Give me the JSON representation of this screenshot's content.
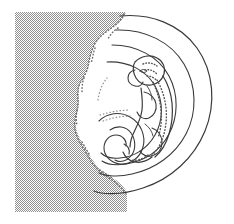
{
  "figure": {
    "title": "Embryo curled within concentric spiral membranes",
    "style": "pen-and-ink line drawing",
    "background_color": "#ffffff",
    "stroke_color": "#3a3a3a",
    "canvas": {
      "width": 234,
      "height": 224
    }
  },
  "regions": {
    "hatched_block": {
      "label": "stippled maternal tissue block",
      "fill_color": "#9e9e9e",
      "pattern": "checkerboard-stipple",
      "pattern_cell_px": 2,
      "bounds": {
        "x": 15,
        "y": 12,
        "width": 115,
        "height": 200
      }
    },
    "scalloped_edge": {
      "label": "scalloped dotted membrane boundary",
      "dot_color": "#6e6e6e",
      "dot_radius": 0.9
    }
  },
  "elements": {
    "spiral_arcs": {
      "label": "concentric membrane spirals",
      "count": 4,
      "stroke_color": "#3a3a3a",
      "stroke_width": 1.1
    },
    "inner_curl": {
      "label": "inner spiral curl",
      "stroke_color": "#3a3a3a"
    },
    "embryo": {
      "label": "embryo body outline",
      "stroke_color": "#3a3a3a",
      "parts": [
        {
          "name": "head",
          "label": "cranium"
        },
        {
          "name": "face",
          "label": "facial profile"
        },
        {
          "name": "torso",
          "label": "trunk"
        },
        {
          "name": "limb-bud-upper",
          "label": "upper limb"
        },
        {
          "name": "limb-bud-lower",
          "label": "lower limb"
        },
        {
          "name": "tail",
          "label": "caudal tail"
        }
      ]
    },
    "vertebral_dots": {
      "label": "dotted vertebral column and skeletal stipple",
      "dot_color": "#555555"
    }
  },
  "colors": {
    "ink": "#3a3a3a",
    "ink_light": "#6e6e6e",
    "gray_fill": "#9e9e9e",
    "paper": "#ffffff"
  }
}
